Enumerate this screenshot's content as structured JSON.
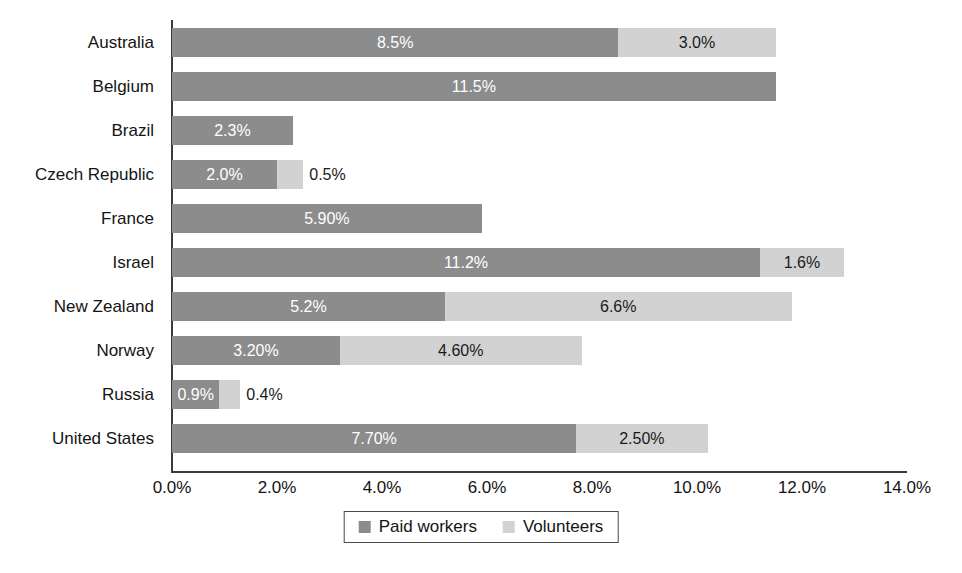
{
  "chart_data": {
    "type": "bar",
    "orientation": "horizontal",
    "stacked": true,
    "title": "",
    "xlabel": "",
    "ylabel": "",
    "xlim": [
      0,
      14
    ],
    "xtick_values": [
      0,
      2,
      4,
      6,
      8,
      10,
      12,
      14
    ],
    "xtick_labels": [
      "0.0%",
      "2.0%",
      "4.0%",
      "6.0%",
      "8.0%",
      "10.0%",
      "12.0%",
      "14.0%"
    ],
    "grid": false,
    "legend_position": "bottom-center",
    "categories": [
      "Australia",
      "Belgium",
      "Brazil",
      "Czech Republic",
      "France",
      "Israel",
      "New Zealand",
      "Norway",
      "Russia",
      "United States"
    ],
    "series": [
      {
        "name": "Paid workers",
        "color": "#8c8c8c",
        "values": [
          8.5,
          11.5,
          2.3,
          2.0,
          5.9,
          11.2,
          5.2,
          3.2,
          0.9,
          7.7
        ],
        "labels": [
          "8.5%",
          "11.5%",
          "2.3%",
          "2.0%",
          "5.90%",
          "11.2%",
          "5.2%",
          "3.20%",
          "0.9%",
          "7.70%"
        ]
      },
      {
        "name": "Volunteers",
        "color": "#d2d2d2",
        "values": [
          3.0,
          0,
          0,
          0.5,
          0,
          1.6,
          6.6,
          4.6,
          0.4,
          2.5
        ],
        "labels": [
          "3.0%",
          "",
          "",
          "0.5%",
          "",
          "1.6%",
          "6.6%",
          "4.60%",
          "0.4%",
          "2.50%"
        ]
      }
    ],
    "totals": [
      11.5,
      11.5,
      2.3,
      2.5,
      5.9,
      12.8,
      11.8,
      7.8,
      1.3,
      10.2
    ]
  },
  "legend": {
    "items": [
      {
        "label": "Paid workers",
        "color": "#8c8c8c"
      },
      {
        "label": "Volunteers",
        "color": "#d2d2d2"
      }
    ]
  }
}
